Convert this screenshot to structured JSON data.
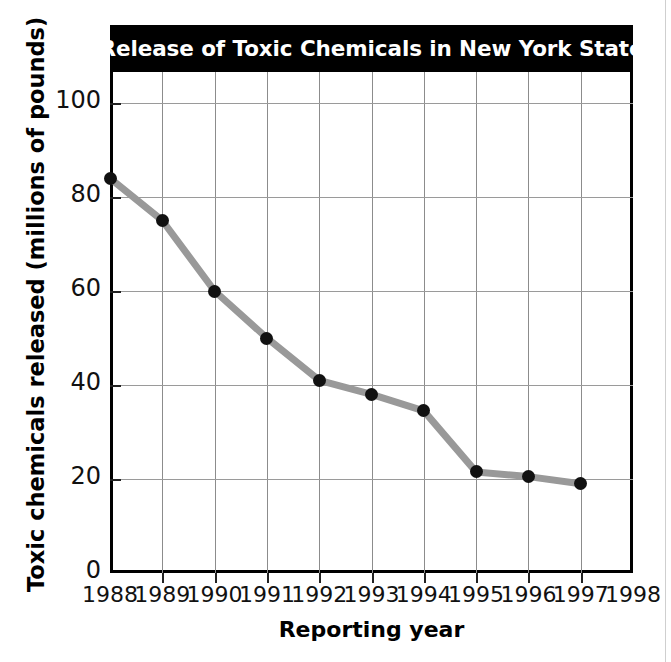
{
  "chart_data": {
    "type": "line",
    "title": "Release of Toxic Chemicals in New York State",
    "xlabel": "Reporting year",
    "ylabel": "Toxic chemicals released (millions of pounds)",
    "x": [
      1988,
      1989,
      1990,
      1991,
      1992,
      1993,
      1994,
      1995,
      1996,
      1997
    ],
    "values": [
      84,
      75,
      60,
      50,
      41,
      38,
      34.5,
      21.5,
      20.5,
      19
    ],
    "xticklabels": [
      "1988",
      "1989",
      "1990",
      "1991",
      "1992",
      "1993",
      "1994",
      "1995",
      "1996",
      "1997",
      "1998"
    ],
    "yticklabels": [
      "0",
      "20",
      "40",
      "60",
      "80",
      "100"
    ],
    "yticks": [
      0,
      20,
      40,
      60,
      80,
      100
    ],
    "xlim": [
      1988,
      1998
    ],
    "ylim": [
      0,
      110
    ],
    "grid": true,
    "legend": false,
    "series_color": "#999999",
    "marker_color": "#111111",
    "title_background": "#000000",
    "title_color": "#ffffff"
  }
}
